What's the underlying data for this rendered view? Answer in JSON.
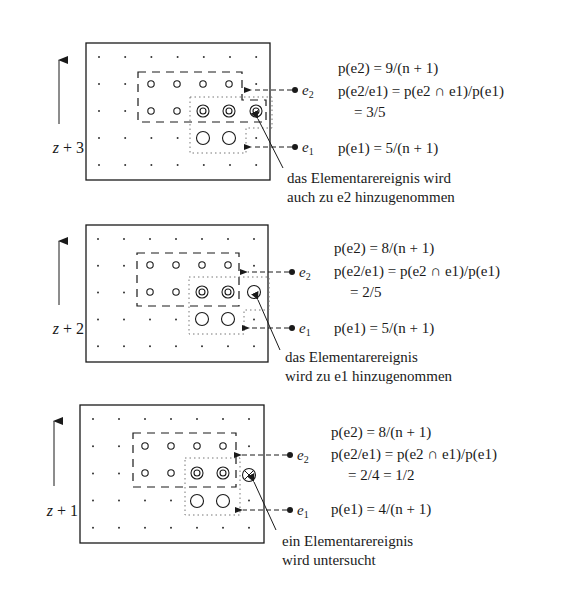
{
  "panels": [
    {
      "id": "z+3",
      "step_label": "z + 3",
      "marker_e2": "e2",
      "marker_e1": "e1",
      "formula_p_e2": "p(e2) = 9/(n + 1)",
      "formula_cond": "p(e2/e1) = p(e2 ∩ e1)/p(e1)",
      "formula_cond_result": "= 3/5",
      "formula_p_e1": "p(e1) = 5/(n + 1)",
      "note_line1": "das Elementarereignis wird",
      "note_line2": "auch zu e2 hinzugenommen",
      "grid": {
        "cols": 7,
        "rows": 5
      },
      "e2_points": [
        [
          3,
          2
        ],
        [
          4,
          2
        ],
        [
          5,
          2
        ],
        [
          6,
          2
        ],
        [
          3,
          3
        ],
        [
          4,
          3
        ],
        [
          5,
          3
        ],
        [
          6,
          3
        ],
        [
          7,
          3
        ]
      ],
      "e1_points": [
        [
          5,
          3
        ],
        [
          6,
          3
        ],
        [
          7,
          3
        ],
        [
          5,
          4
        ],
        [
          6,
          4
        ]
      ],
      "examined_point": [
        7,
        3
      ],
      "examined_state": "added_to_e1_and_e2"
    },
    {
      "id": "z+2",
      "step_label": "z + 2",
      "marker_e2": "e2",
      "marker_e1": "e1",
      "formula_p_e2": "p(e2) = 8/(n + 1)",
      "formula_cond": "p(e2/e1) = p(e2 ∩ e1)/p(e1)",
      "formula_cond_result": "= 2/5",
      "formula_p_e1": "p(e1) = 5/(n + 1)",
      "note_line1": "das Elementarereignis",
      "note_line2": "wird zu e1 hinzugenommen",
      "grid": {
        "cols": 7,
        "rows": 5
      },
      "e2_points": [
        [
          3,
          2
        ],
        [
          4,
          2
        ],
        [
          5,
          2
        ],
        [
          6,
          2
        ],
        [
          3,
          3
        ],
        [
          4,
          3
        ],
        [
          5,
          3
        ],
        [
          6,
          3
        ]
      ],
      "e1_points": [
        [
          5,
          3
        ],
        [
          6,
          3
        ],
        [
          7,
          3
        ],
        [
          5,
          4
        ],
        [
          6,
          4
        ]
      ],
      "examined_point": [
        7,
        3
      ],
      "examined_state": "added_to_e1"
    },
    {
      "id": "z+1",
      "step_label": "z + 1",
      "marker_e2": "e2",
      "marker_e1": "e1",
      "formula_p_e2": "p(e2) = 8/(n + 1)",
      "formula_cond": "p(e2/e1) = p(e2 ∩ e1)/p(e1)",
      "formula_cond_result": "= 2/4 = 1/2",
      "formula_p_e1": "p(e1) = 4/(n + 1)",
      "note_line1": "ein Elementarereignis",
      "note_line2": "wird untersucht",
      "grid": {
        "cols": 7,
        "rows": 5
      },
      "e2_points": [
        [
          3,
          2
        ],
        [
          4,
          2
        ],
        [
          5,
          2
        ],
        [
          6,
          2
        ],
        [
          3,
          3
        ],
        [
          4,
          3
        ],
        [
          5,
          3
        ],
        [
          6,
          3
        ]
      ],
      "e1_points": [
        [
          5,
          3
        ],
        [
          6,
          3
        ],
        [
          5,
          4
        ],
        [
          6,
          4
        ]
      ],
      "examined_point": [
        7,
        3
      ],
      "examined_state": "under_examination"
    }
  ],
  "legend": {
    "small_circle": "element of e2 only",
    "double_circle": "element of e2 ∩ e1",
    "large_circle": "element of e1 only",
    "crossed_circle": "element being examined",
    "dot": "elementary event"
  },
  "colors": {
    "ink": "#1a1a1a",
    "background": "#ffffff",
    "dotted": "#888888"
  }
}
